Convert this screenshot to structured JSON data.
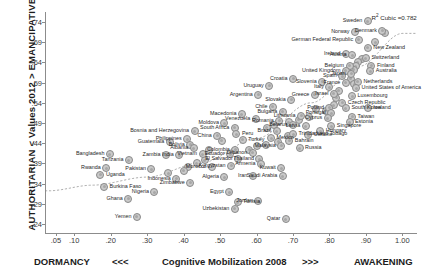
{
  "axes": {
    "y_title": "AUTHORITARIAN < Values 2012 > EMANCIPATIVE",
    "x_left": "DORMANCY",
    "x_left_arrows": "<<<",
    "x_title": "Cognitive Mobilization 2008",
    "x_right_arrows": ">>>",
    "x_right": "AWAKENING"
  },
  "annotation": {
    "r2_prefix": "R",
    "r2_sup": "2",
    "r2_text": " Cubic =0.782"
  },
  "chart_data": {
    "type": "scatter",
    "title": "",
    "xlabel": "Cognitive Mobilization 2008",
    "ylabel": "AUTHORITARIAN < Values 2012 > EMANCIPATIVE",
    "xlim": [
      0.02,
      1.04
    ],
    "ylim": [
      0.215,
      0.765
    ],
    "xticks": [
      0.05,
      0.1,
      0.2,
      0.3,
      0.4,
      0.5,
      0.6,
      0.7,
      0.8,
      0.9,
      1.0
    ],
    "xticklabels": [
      ".05",
      ".10",
      ".20",
      ".30",
      ".40",
      ".50",
      ".60",
      ".70",
      ".80",
      ".90",
      "1.00"
    ],
    "yticks": [
      0.24,
      0.29,
      0.34,
      0.39,
      0.44,
      0.49,
      0.54,
      0.59,
      0.64,
      0.69,
      0.74
    ],
    "yticklabels": [
      ".24",
      ".29",
      ".34",
      ".39",
      ".44",
      ".49",
      ".54",
      ".59",
      ".64",
      ".69",
      ".74"
    ],
    "grid": false,
    "legend": false,
    "fit": {
      "type": "cubic",
      "r_squared": 0.782,
      "label": "R² Cubic =0.782"
    },
    "points": [
      {
        "label": "Sweden",
        "x": 0.905,
        "y": 0.742,
        "side": "r"
      },
      {
        "label": "Denmark",
        "x": 0.945,
        "y": 0.718,
        "side": "r"
      },
      {
        "label": "Norway",
        "x": 0.87,
        "y": 0.716,
        "side": "r"
      },
      {
        "label": "German Federal Republic",
        "x": 0.88,
        "y": 0.696,
        "side": "r"
      },
      {
        "label": "New Zealand",
        "x": 0.905,
        "y": 0.676,
        "side": "l"
      },
      {
        "label": "Ireland",
        "x": 0.845,
        "y": 0.66,
        "side": "r"
      },
      {
        "label": "Austria",
        "x": 0.862,
        "y": 0.658,
        "side": "r"
      },
      {
        "label": "Switzerland",
        "x": 0.9,
        "y": 0.65,
        "side": "l"
      },
      {
        "label": "Belgium",
        "x": 0.855,
        "y": 0.632,
        "side": "r"
      },
      {
        "label": "Finland",
        "x": 0.915,
        "y": 0.632,
        "side": "l"
      },
      {
        "label": "Australia",
        "x": 0.912,
        "y": 0.618,
        "side": "l"
      },
      {
        "label": "United Kingdom",
        "x": 0.845,
        "y": 0.62,
        "side": "r"
      },
      {
        "label": "Japan",
        "x": 0.86,
        "y": 0.612,
        "side": "r"
      },
      {
        "label": "Spain",
        "x": 0.835,
        "y": 0.606,
        "side": "r"
      },
      {
        "label": "France",
        "x": 0.845,
        "y": 0.59,
        "side": "r"
      },
      {
        "label": "Netherlands",
        "x": 0.878,
        "y": 0.592,
        "side": "l"
      },
      {
        "label": "United States of America",
        "x": 0.873,
        "y": 0.576,
        "side": "l"
      },
      {
        "label": "Slovenia",
        "x": 0.78,
        "y": 0.592,
        "side": "r"
      },
      {
        "label": "Italy",
        "x": 0.8,
        "y": 0.578,
        "side": "r"
      },
      {
        "label": "Croatia",
        "x": 0.7,
        "y": 0.6,
        "side": "r"
      },
      {
        "label": "Uruguay",
        "x": 0.635,
        "y": 0.582,
        "side": "r"
      },
      {
        "label": "Israel",
        "x": 0.812,
        "y": 0.562,
        "side": "r"
      },
      {
        "label": "Greece",
        "x": 0.76,
        "y": 0.56,
        "side": "r"
      },
      {
        "label": "Luxembourg",
        "x": 0.862,
        "y": 0.556,
        "side": "l"
      },
      {
        "label": "Argentina",
        "x": 0.605,
        "y": 0.56,
        "side": "r"
      },
      {
        "label": "Slovakia",
        "x": 0.695,
        "y": 0.548,
        "side": "r"
      },
      {
        "label": "Czech Republic",
        "x": 0.835,
        "y": 0.54,
        "side": "l"
      },
      {
        "label": "Chile",
        "x": 0.645,
        "y": 0.53,
        "side": "r"
      },
      {
        "label": "Poland",
        "x": 0.8,
        "y": 0.528,
        "side": "r"
      },
      {
        "label": "South Korea",
        "x": 0.845,
        "y": 0.526,
        "side": "l"
      },
      {
        "label": "Iceland",
        "x": 0.905,
        "y": 0.528,
        "side": "l"
      },
      {
        "label": "Bulgaria",
        "x": 0.672,
        "y": 0.518,
        "side": "r"
      },
      {
        "label": "Portugal",
        "x": 0.805,
        "y": 0.514,
        "side": "r"
      },
      {
        "label": "Lithuania",
        "x": 0.722,
        "y": 0.508,
        "side": "r"
      },
      {
        "label": "Cyprus",
        "x": 0.795,
        "y": 0.502,
        "side": "r"
      },
      {
        "label": "Taiwan",
        "x": 0.862,
        "y": 0.506,
        "side": "l"
      },
      {
        "label": "Estonia",
        "x": 0.855,
        "y": 0.492,
        "side": "l"
      },
      {
        "label": "Venezuela",
        "x": 0.598,
        "y": 0.5,
        "side": "r"
      },
      {
        "label": "Romania",
        "x": 0.662,
        "y": 0.496,
        "side": "r"
      },
      {
        "label": "Belarus",
        "x": 0.7,
        "y": 0.486,
        "side": "r"
      },
      {
        "label": "Latvia",
        "x": 0.735,
        "y": 0.482,
        "side": "r"
      },
      {
        "label": "Singapore",
        "x": 0.805,
        "y": 0.482,
        "side": "l"
      },
      {
        "label": "Hungary",
        "x": 0.775,
        "y": 0.47,
        "side": "l"
      },
      {
        "label": "Macedonia",
        "x": 0.56,
        "y": 0.512,
        "side": "r"
      },
      {
        "label": "Moldova",
        "x": 0.512,
        "y": 0.49,
        "side": "r"
      },
      {
        "label": "South Africa",
        "x": 0.54,
        "y": 0.478,
        "side": "r"
      },
      {
        "label": "Brazil",
        "x": 0.655,
        "y": 0.47,
        "side": "r"
      },
      {
        "label": "Trinidad and Tobago",
        "x": 0.7,
        "y": 0.462,
        "side": "l"
      },
      {
        "label": "Ukraine",
        "x": 0.742,
        "y": 0.46,
        "side": "l"
      },
      {
        "label": "Bosnia and Herzegovina",
        "x": 0.43,
        "y": 0.47,
        "side": "r"
      },
      {
        "label": "Peru",
        "x": 0.545,
        "y": 0.462,
        "side": "l"
      },
      {
        "label": "Mexico",
        "x": 0.64,
        "y": 0.452,
        "side": "l"
      },
      {
        "label": "China",
        "x": 0.492,
        "y": 0.458,
        "side": "r"
      },
      {
        "label": "Turkey",
        "x": 0.562,
        "y": 0.448,
        "side": "l"
      },
      {
        "label": "Bahrain",
        "x": 0.69,
        "y": 0.446,
        "side": "l"
      },
      {
        "label": "Malaysia",
        "x": 0.668,
        "y": 0.434,
        "side": "r"
      },
      {
        "label": "Russia",
        "x": 0.718,
        "y": 0.428,
        "side": "l"
      },
      {
        "label": "Philippines",
        "x": 0.41,
        "y": 0.45,
        "side": "r"
      },
      {
        "label": "Guatemala",
        "x": 0.362,
        "y": 0.444,
        "side": "r"
      },
      {
        "label": "Bolivia",
        "x": 0.418,
        "y": 0.436,
        "side": "r"
      },
      {
        "label": "Albania",
        "x": 0.428,
        "y": 0.428,
        "side": "r"
      },
      {
        "label": "Colombia",
        "x": 0.542,
        "y": 0.424,
        "side": "r"
      },
      {
        "label": "Lebanon",
        "x": 0.59,
        "y": 0.416,
        "side": "r"
      },
      {
        "label": "Ecuador",
        "x": 0.528,
        "y": 0.412,
        "side": "r"
      },
      {
        "label": "Vietnam",
        "x": 0.452,
        "y": 0.412,
        "side": "r"
      },
      {
        "label": "Zambia",
        "x": 0.352,
        "y": 0.41,
        "side": "r"
      },
      {
        "label": "India",
        "x": 0.388,
        "y": 0.41,
        "side": "r"
      },
      {
        "label": "Bangladesh",
        "x": 0.198,
        "y": 0.412,
        "side": "r"
      },
      {
        "label": "Tanzania",
        "x": 0.25,
        "y": 0.398,
        "side": "r"
      },
      {
        "label": "El Salvador",
        "x": 0.55,
        "y": 0.4,
        "side": "r"
      },
      {
        "label": "Thailand",
        "x": 0.608,
        "y": 0.4,
        "side": "r"
      },
      {
        "label": "Armenia",
        "x": 0.612,
        "y": 0.388,
        "side": "r"
      },
      {
        "label": "Kyrgyzstan",
        "x": 0.53,
        "y": 0.384,
        "side": "r"
      },
      {
        "label": "Morocco",
        "x": 0.478,
        "y": 0.382,
        "side": "r"
      },
      {
        "label": "Rwanda",
        "x": 0.188,
        "y": 0.378,
        "side": "r"
      },
      {
        "label": "Pakistan",
        "x": 0.312,
        "y": 0.376,
        "side": "r"
      },
      {
        "label": "Uganda",
        "x": 0.172,
        "y": 0.362,
        "side": "l"
      },
      {
        "label": "Kuwait",
        "x": 0.668,
        "y": 0.378,
        "side": "r"
      },
      {
        "label": "Saudi Arabia",
        "x": 0.672,
        "y": 0.358,
        "side": "r"
      },
      {
        "label": "Iran",
        "x": 0.59,
        "y": 0.358,
        "side": "r"
      },
      {
        "label": "Algeria",
        "x": 0.512,
        "y": 0.356,
        "side": "r"
      },
      {
        "label": "Indonesia",
        "x": 0.38,
        "y": 0.352,
        "side": "r"
      },
      {
        "label": "Zimbabwe",
        "x": 0.418,
        "y": 0.342,
        "side": "r"
      },
      {
        "label": "Burkina Faso",
        "x": 0.182,
        "y": 0.332,
        "side": "l"
      },
      {
        "label": "Nigeria",
        "x": 0.32,
        "y": 0.318,
        "side": "r"
      },
      {
        "label": "Egypt",
        "x": 0.525,
        "y": 0.318,
        "side": "r"
      },
      {
        "label": "Ghana",
        "x": 0.248,
        "y": 0.302,
        "side": "r"
      },
      {
        "label": "Tunisia",
        "x": 0.548,
        "y": 0.294,
        "side": "l"
      },
      {
        "label": "Jordan",
        "x": 0.605,
        "y": 0.296,
        "side": "r"
      },
      {
        "label": "Uzbekistan",
        "x": 0.54,
        "y": 0.278,
        "side": "r"
      },
      {
        "label": "Yemen",
        "x": 0.272,
        "y": 0.258,
        "side": "r"
      },
      {
        "label": "Qatar",
        "x": 0.68,
        "y": 0.252,
        "side": "r"
      }
    ],
    "extra_points": [
      {
        "x": 0.925,
        "y": 0.69
      },
      {
        "x": 0.952,
        "y": 0.712
      },
      {
        "x": 0.888,
        "y": 0.648
      },
      {
        "x": 0.878,
        "y": 0.64
      },
      {
        "x": 0.872,
        "y": 0.63
      },
      {
        "x": 0.866,
        "y": 0.622
      },
      {
        "x": 0.858,
        "y": 0.6
      },
      {
        "x": 0.868,
        "y": 0.586
      },
      {
        "x": 0.826,
        "y": 0.57
      },
      {
        "x": 0.818,
        "y": 0.552
      },
      {
        "x": 0.812,
        "y": 0.534
      },
      {
        "x": 0.79,
        "y": 0.52
      },
      {
        "x": 0.762,
        "y": 0.524
      },
      {
        "x": 0.745,
        "y": 0.506
      },
      {
        "x": 0.716,
        "y": 0.498
      },
      {
        "x": 0.688,
        "y": 0.492
      },
      {
        "x": 0.648,
        "y": 0.486
      },
      {
        "x": 0.628,
        "y": 0.478
      },
      {
        "x": 0.686,
        "y": 0.458
      },
      {
        "x": 0.66,
        "y": 0.444
      },
      {
        "x": 0.625,
        "y": 0.436
      },
      {
        "x": 0.602,
        "y": 0.432
      },
      {
        "x": 0.58,
        "y": 0.424
      },
      {
        "x": 0.505,
        "y": 0.446
      },
      {
        "x": 0.47,
        "y": 0.424
      },
      {
        "x": 0.458,
        "y": 0.398
      },
      {
        "x": 0.436,
        "y": 0.39
      },
      {
        "x": 0.412,
        "y": 0.382
      },
      {
        "x": 0.4,
        "y": 0.372
      },
      {
        "x": 0.358,
        "y": 0.366
      }
    ]
  }
}
